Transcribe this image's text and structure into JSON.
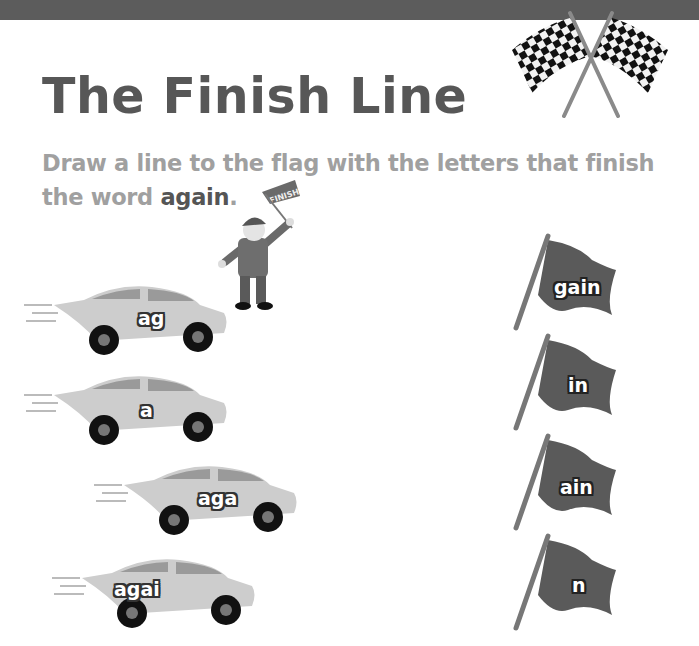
{
  "page": {
    "title": "The Finish Line",
    "instruction_prefix": "Draw a line to the flag with the letters that finish the word ",
    "instruction_keyword": "again",
    "instruction_suffix": "."
  },
  "flagman": {
    "banner_text": "FINISH"
  },
  "cars": [
    {
      "label": "ag"
    },
    {
      "label": "a"
    },
    {
      "label": "aga"
    },
    {
      "label": "agai"
    }
  ],
  "flags": [
    {
      "label": "gain"
    },
    {
      "label": "in"
    },
    {
      "label": "ain"
    },
    {
      "label": "n"
    }
  ],
  "colors": {
    "topbar": "#5c5c5c",
    "title": "#575757",
    "instruction": "#a0a0a0",
    "keyword": "#555555",
    "car_body": "#c8c8c8",
    "flag_cloth": "#5a5a5a"
  }
}
